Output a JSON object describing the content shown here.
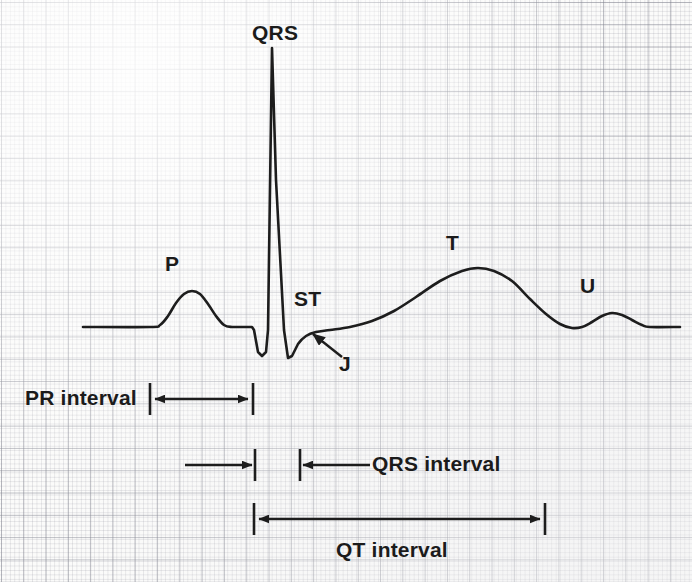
{
  "figure": {
    "kind": "ecg-waveform-diagram",
    "background": "#fbfbfa",
    "trace_color": "#1d1d1d",
    "grid_color": "#80828e",
    "width": 692,
    "height": 582
  },
  "wave_labels": {
    "p": "P",
    "qrs": "QRS",
    "st": "ST",
    "j": "J",
    "t": "T",
    "u": "U"
  },
  "interval_labels": {
    "pr": "PR interval",
    "qrs": "QRS interval",
    "qt": "QT interval"
  },
  "chart_data": {
    "type": "line",
    "title": "",
    "xlabel": "",
    "ylabel": "",
    "grid": true,
    "legend": "none",
    "baseline_y": 327,
    "series": [
      {
        "name": "ECG trace",
        "points": [
          [
            83,
            327
          ],
          [
            150,
            327
          ],
          [
            160,
            325
          ],
          [
            168,
            316
          ],
          [
            176,
            303
          ],
          [
            184,
            294
          ],
          [
            192,
            291
          ],
          [
            200,
            294
          ],
          [
            208,
            304
          ],
          [
            216,
            316
          ],
          [
            224,
            325
          ],
          [
            232,
            327
          ],
          [
            252,
            327
          ],
          [
            254,
            330
          ],
          [
            258,
            352
          ],
          [
            262,
            356
          ],
          [
            266,
            352
          ],
          [
            268,
            330
          ],
          [
            272,
            48
          ],
          [
            276,
            180
          ],
          [
            284,
            330
          ],
          [
            288,
            358
          ],
          [
            292,
            356
          ],
          [
            298,
            344
          ],
          [
            306,
            336
          ],
          [
            316,
            332
          ],
          [
            330,
            330
          ],
          [
            350,
            327
          ],
          [
            372,
            321
          ],
          [
            394,
            311
          ],
          [
            416,
            297
          ],
          [
            440,
            281
          ],
          [
            462,
            271
          ],
          [
            478,
            268
          ],
          [
            494,
            271
          ],
          [
            512,
            281
          ],
          [
            530,
            299
          ],
          [
            546,
            314
          ],
          [
            560,
            324
          ],
          [
            572,
            328
          ],
          [
            582,
            327
          ],
          [
            592,
            322
          ],
          [
            602,
            316
          ],
          [
            612,
            313
          ],
          [
            622,
            315
          ],
          [
            632,
            320
          ],
          [
            642,
            325
          ],
          [
            650,
            327
          ],
          [
            680,
            327
          ]
        ]
      }
    ],
    "annotations": [
      {
        "name": "P",
        "label": "P",
        "x": 172,
        "y": 268
      },
      {
        "name": "QRS",
        "label": "QRS",
        "x": 258,
        "y": 30
      },
      {
        "name": "ST",
        "label": "ST",
        "x": 300,
        "y": 298
      },
      {
        "name": "J",
        "label": "J",
        "x": 344,
        "y": 361
      },
      {
        "name": "T",
        "label": "T",
        "x": 450,
        "y": 245
      },
      {
        "name": "U",
        "label": "U",
        "x": 584,
        "y": 287
      }
    ],
    "intervals": [
      {
        "name": "PR interval",
        "label": "PR interval",
        "x_start": 150,
        "x_end": 253,
        "row_y": 399,
        "arrows": "inside-double",
        "label_x": 25,
        "label_y": 387
      },
      {
        "name": "QRS interval",
        "label": "QRS interval",
        "x_start": 255,
        "x_end": 300,
        "row_y": 465,
        "arrows": "outside-double",
        "label_x": 372,
        "label_y": 453
      },
      {
        "name": "QT interval",
        "label": "QT interval",
        "x_start": 254,
        "x_end": 545,
        "row_y": 519,
        "arrows": "inside-double",
        "label_x": 336,
        "label_y": 539
      }
    ]
  }
}
